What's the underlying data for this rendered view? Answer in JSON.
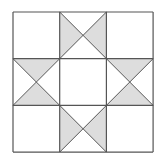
{
  "diagram": {
    "grid": {
      "rows": 3,
      "cols": 3,
      "x0": 13,
      "y0": 12,
      "cell": 46.7
    },
    "colors": {
      "fill": "#dddddd",
      "stroke": "#555555",
      "background": "#ffffff"
    },
    "cells": [
      {
        "row": 0,
        "col": 0,
        "type": "plain"
      },
      {
        "row": 0,
        "col": 1,
        "type": "hourglass",
        "shaded": [
          "left",
          "right"
        ]
      },
      {
        "row": 0,
        "col": 2,
        "type": "plain"
      },
      {
        "row": 1,
        "col": 0,
        "type": "hourglass",
        "shaded": [
          "top",
          "bottom"
        ]
      },
      {
        "row": 1,
        "col": 1,
        "type": "plain"
      },
      {
        "row": 1,
        "col": 2,
        "type": "hourglass",
        "shaded": [
          "top",
          "bottom"
        ]
      },
      {
        "row": 2,
        "col": 0,
        "type": "plain"
      },
      {
        "row": 2,
        "col": 1,
        "type": "hourglass",
        "shaded": [
          "left",
          "right"
        ]
      },
      {
        "row": 2,
        "col": 2,
        "type": "plain"
      }
    ]
  }
}
